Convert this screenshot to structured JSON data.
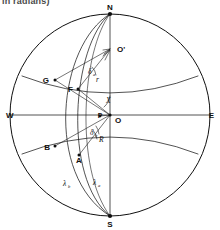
{
  "figure": {
    "caption_fragment": "in radians)",
    "background_color": "#ffffff",
    "line_color": "#101010"
  },
  "cardinal_points": [
    {
      "id": "north",
      "label": "N",
      "x": 110,
      "y": 14
    },
    {
      "id": "south",
      "label": "S",
      "x": 110,
      "y": 216
    },
    {
      "id": "west",
      "label": "W",
      "x": 9,
      "y": 115
    },
    {
      "id": "east",
      "label": "E",
      "x": 211,
      "y": 115
    }
  ],
  "points": [
    {
      "id": "center",
      "label": "O",
      "x": 110,
      "y": 115
    },
    {
      "id": "pole-aux",
      "label": "O'",
      "x": 110,
      "y": 49
    },
    {
      "id": "point-g",
      "label": "G",
      "x": 55,
      "y": 80
    },
    {
      "id": "point-f",
      "label": "F",
      "x": 78,
      "y": 89
    },
    {
      "id": "point-b",
      "label": "B",
      "x": 55,
      "y": 146
    },
    {
      "id": "point-a",
      "label": "A",
      "x": 79,
      "y": 155
    },
    {
      "id": "point-p",
      "label": "P",
      "x": 100,
      "y": 116
    }
  ],
  "angle_labels": [
    {
      "id": "delta-upper",
      "symbol": "δ",
      "subscript": "a",
      "x": 91,
      "y": 72
    },
    {
      "id": "delta-lower",
      "symbol": "δ",
      "subscript": "b",
      "x": 93,
      "y": 133
    },
    {
      "id": "angle-x",
      "symbol": "X",
      "subscript": "",
      "x": 108,
      "y": 100
    },
    {
      "id": "radius-r",
      "symbol": "r",
      "subscript": "",
      "x": 98,
      "y": 79
    },
    {
      "id": "radius-cap-r",
      "symbol": "R",
      "subscript": "",
      "x": 101,
      "y": 139
    }
  ],
  "arc_labels": [
    {
      "id": "lambda-b",
      "symbol": "λ",
      "subscript": "b",
      "x": 66,
      "y": 184
    },
    {
      "id": "lambda-a",
      "symbol": "λ",
      "subscript": "a",
      "x": 96,
      "y": 183
    }
  ],
  "geometry": {
    "sphere_center_x": 110,
    "sphere_center_y": 115,
    "sphere_radius_x": 100,
    "sphere_radius_y": 101,
    "equator_label": "horizontal axis W-E",
    "meridian_label": "vertical axis N-S"
  }
}
